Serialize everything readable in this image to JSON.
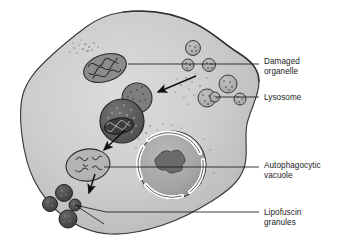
{
  "figure": {
    "title_fragment_left": "",
    "title_fragment_right": "",
    "kind": "biology-diagram",
    "background_color": "#ffffff"
  },
  "colors": {
    "cell_fill": "#c9c9c9",
    "cell_fill_light": "#d8d8d8",
    "cell_outline": "#3a3a3a",
    "nucleus_fill": "#a8a8a8",
    "nucleolus_fill": "#6a6a6a",
    "nuclear_envelope": "#ffffff",
    "lysosome_fill": "#b2b2b2",
    "lysosome_outline": "#4a4a4a",
    "vacuole_dark": "#5e5e5e",
    "mitochondrion_fill": "#8f8f8f",
    "residual_body_fill": "#b4b4b4",
    "lipofuscin_fill": "#4f4f4f",
    "leader_line": "#1b1b1b",
    "arrow": "#111111",
    "label_text": "#1b1b1b"
  },
  "labels": [
    {
      "id": "damaged-organelle",
      "lines": [
        "Damaged",
        "organelle"
      ],
      "line1": "Damaged",
      "line2": "organelle",
      "text_x": 264,
      "text_y1": 64,
      "text_y2": 74,
      "leader": {
        "x1": 128,
        "y1": 64,
        "x2": 259,
        "y2": 64
      }
    },
    {
      "id": "lysosome",
      "lines": [
        "Lysosome"
      ],
      "line1": "Lysosome",
      "line2": "",
      "text_x": 264,
      "text_y1": 97,
      "text_y2": 0,
      "leader": {
        "x1": 215,
        "y1": 97,
        "x2": 259,
        "y2": 97
      }
    },
    {
      "id": "autophagocytic-vacuole",
      "lines": [
        "Autophagocytic",
        "vacuole"
      ],
      "line1": "Autophagocytic",
      "line2": "vacuole",
      "text_x": 264,
      "text_y1": 168,
      "text_y2": 178,
      "leader": {
        "x1": 104,
        "y1": 167,
        "x2": 259,
        "y2": 167
      }
    },
    {
      "id": "lipofuscin-granules",
      "lines": [
        "Lipofuscin",
        "granules"
      ],
      "line1": "Lipofuscin",
      "line2": "granules",
      "text_x": 264,
      "text_y1": 212,
      "text_y2": 222,
      "leader": {
        "x1": 178,
        "y1": 212,
        "x2": 259,
        "y2": 212
      }
    }
  ],
  "structures": {
    "cell_name": "cell-body",
    "nucleus_name": "nucleus",
    "nucleolus_name": "nucleolus",
    "damaged_mitochondrion_name": "damaged-mitochondrion",
    "fusing_lysosome_name": "fusing-lysosome",
    "autophagic_vacuole_name": "autophagocytic-vacuole",
    "residual_body_name": "residual-body",
    "lipofuscin_count": 4,
    "free_lysosome_count": 7
  },
  "arrows": [
    {
      "id": "arrow-engulf",
      "x1": 196,
      "y1": 76,
      "x2": 157,
      "y2": 92
    },
    {
      "id": "arrow-digest",
      "x1": 125,
      "y1": 130,
      "x2": 103,
      "y2": 151
    },
    {
      "id": "arrow-residue",
      "x1": 95,
      "y1": 174,
      "x2": 88,
      "y2": 195
    }
  ]
}
